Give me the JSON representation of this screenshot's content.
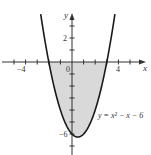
{
  "chart_data": {
    "type": "line",
    "title": "",
    "function": "y = x^2 - x - 6",
    "equation_label": "y = x² − x − 6",
    "xlabel": "x",
    "ylabel": "y",
    "x_tick_labels": [
      "-4",
      "0",
      "4"
    ],
    "y_tick_labels": [
      "2",
      "-6"
    ],
    "x_ticks": [
      -5,
      -4,
      -3,
      -2,
      -1,
      1,
      2,
      3,
      4,
      5
    ],
    "y_ticks": [
      -7,
      -6,
      -5,
      -4,
      -3,
      -2,
      -1,
      1,
      2,
      3
    ],
    "xlim": [
      -5.5,
      6
    ],
    "ylim": [
      -7.7,
      4.5
    ],
    "curve_x_range": [
      -2.7,
      3.7
    ],
    "shaded_region": {
      "from_x": -2,
      "to_x": 3,
      "between": "curve and x-axis"
    },
    "roots": [
      -2,
      3
    ],
    "vertex": [
      0.5,
      -6.25
    ],
    "colors": {
      "curve": "#1a1a1a",
      "shade": "#d9d9d9",
      "axis": "#333333"
    }
  },
  "labels": {
    "x_axis": "x",
    "y_axis": "y",
    "x_neg4": "−4",
    "x_0": "0",
    "x_4": "4",
    "y_2": "2",
    "y_neg6": "−6",
    "equation": "y = x² − x − 6"
  }
}
